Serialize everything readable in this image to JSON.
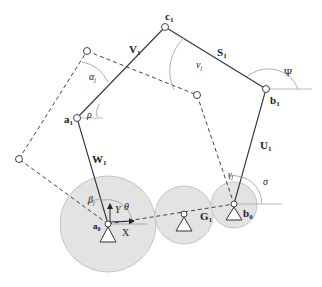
{
  "diagram": {
    "colors": {
      "gear_fill": "#e3e3e3",
      "gear_stroke": "#bdbdbd",
      "line": "#333333",
      "dashed": "#444444",
      "thin": "#aaaaaa"
    },
    "points": {
      "a0": {
        "label": "a",
        "sub": "0"
      },
      "a1": {
        "label": "a",
        "sub": "1"
      },
      "b0": {
        "label": "b",
        "sub": "0"
      },
      "b1": {
        "label": "b",
        "sub": "1"
      },
      "c1": {
        "label": "c",
        "sub": "1"
      }
    },
    "links": {
      "W": {
        "label": "W",
        "sub": "1"
      },
      "V": {
        "label": "V",
        "sub": "1"
      },
      "S": {
        "label": "S",
        "sub": "1"
      },
      "U": {
        "label": "U",
        "sub": "1"
      },
      "G": {
        "label": "G",
        "sub": "1"
      }
    },
    "angles": {
      "alpha": {
        "label": "α",
        "sub": "j"
      },
      "beta": {
        "label": "β",
        "sub": "j"
      },
      "gamma": {
        "label": "γ",
        "sub": "j"
      },
      "nu": {
        "label": "ν",
        "sub": "j"
      },
      "rho": {
        "label": "ρ"
      },
      "theta": {
        "label": "θ"
      },
      "psi": {
        "label": "Ψ"
      },
      "sigma": {
        "label": "σ"
      }
    },
    "axes": {
      "x": "X",
      "y": "Y"
    }
  }
}
